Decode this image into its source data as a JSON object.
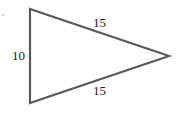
{
  "diagram": {
    "type": "triangle",
    "shape": "isosceles",
    "stroke_color": "#5a5a5a",
    "vertices": [
      [
        30,
        9
      ],
      [
        30,
        103
      ],
      [
        169,
        56
      ]
    ],
    "sides": [
      {
        "name": "top",
        "label": "15"
      },
      {
        "name": "left",
        "label": "10"
      },
      {
        "name": "bottom",
        "label": "15"
      }
    ]
  }
}
